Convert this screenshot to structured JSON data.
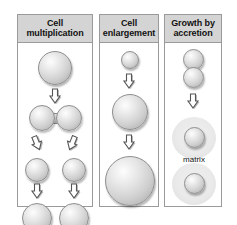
{
  "figure": {
    "title_text": "Mechanisms of tissue growth",
    "background_color": "#ffffff",
    "border_color": "#9a9a9a",
    "header_fill": "#d4d4d4",
    "cell_fill": "#e0e0e0",
    "matrix_fill": "#e9e9e9"
  },
  "panels": [
    {
      "id": "cell-multiplication",
      "title": "Cell\nmultiplication",
      "title_line1": "Cell",
      "title_line2": "multiplication",
      "steps": [
        {
          "label": "single cell",
          "shape": "sphere",
          "count": 1
        },
        {
          "label": "dividing cell",
          "shape": "dumbbell",
          "count": 1
        },
        {
          "label": "two daughter cells",
          "shape": "sphere",
          "count": 2
        },
        {
          "label": "two grown daughter cells",
          "shape": "sphere",
          "count": 2
        }
      ],
      "arrows": [
        {
          "direction": "down"
        },
        {
          "direction": "down-left"
        },
        {
          "direction": "down-right"
        },
        {
          "direction": "down"
        },
        {
          "direction": "down"
        }
      ]
    },
    {
      "id": "cell-enlargement",
      "title": "Cell\nenlargement",
      "title_line1": "Cell",
      "title_line2": "enlargement",
      "steps": [
        {
          "label": "small cell",
          "shape": "sphere",
          "count": 1
        },
        {
          "label": "medium cell",
          "shape": "sphere",
          "count": 1
        },
        {
          "label": "large cell",
          "shape": "sphere",
          "count": 1
        }
      ],
      "arrows": [
        {
          "direction": "down"
        },
        {
          "direction": "down"
        }
      ]
    },
    {
      "id": "growth-by-accretion",
      "title": "Growth by\naccretion",
      "title_line1": "Growth by",
      "title_line2": "accretion",
      "matrix_label": "matrix",
      "steps": [
        {
          "label": "two adjacent cells",
          "shape": "sphere",
          "count": 2
        },
        {
          "label": "cells surrounded by matrix",
          "shape": "sphere-in-matrix",
          "count": 2
        }
      ],
      "arrows": [
        {
          "direction": "down"
        }
      ]
    }
  ]
}
